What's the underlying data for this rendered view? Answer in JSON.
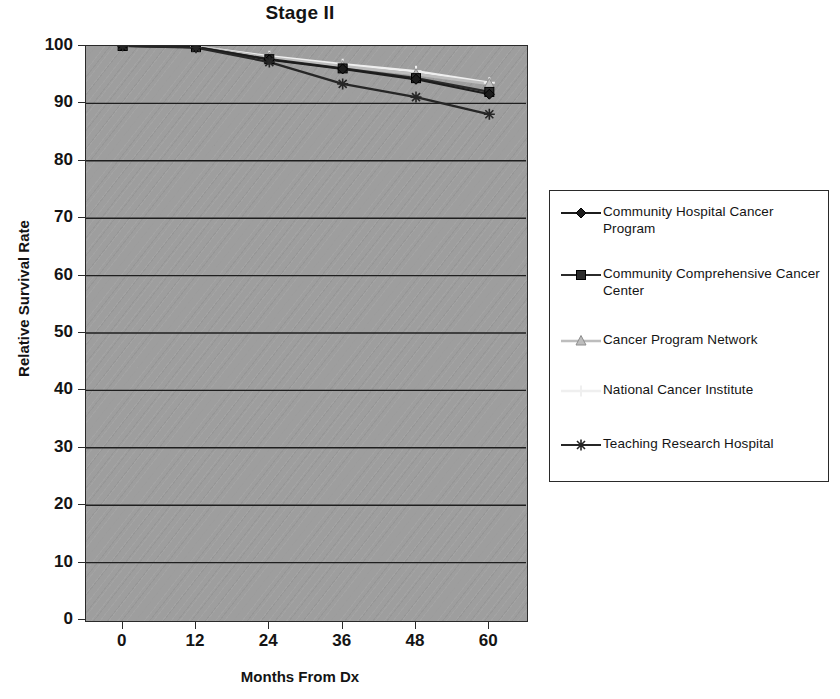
{
  "chart_data": {
    "type": "line",
    "title": "Stage II",
    "xlabel": "Months From Dx",
    "ylabel": "Relative Survival Rate",
    "x": [
      0,
      12,
      24,
      36,
      48,
      60
    ],
    "xticklabels": [
      "0",
      "12",
      "24",
      "36",
      "48",
      "60"
    ],
    "xlim": [
      -6,
      66
    ],
    "ylim": [
      0,
      100
    ],
    "yticks": [
      0,
      10,
      20,
      30,
      40,
      50,
      60,
      70,
      80,
      90,
      100
    ],
    "yticklabels": [
      "0",
      "10",
      "20",
      "30",
      "40",
      "50",
      "60",
      "70",
      "80",
      "90",
      "100"
    ],
    "grid": "horizontal",
    "legend_position": "right",
    "series": [
      {
        "name": "Community Hospital Cancer Program",
        "marker": "diamond",
        "color": "#1c1c1c",
        "values": [
          100,
          99.8,
          97.6,
          96.0,
          94.2,
          91.6
        ]
      },
      {
        "name": "Community Comprehensive Cancer Center",
        "marker": "square",
        "color": "#2b2b2b",
        "values": [
          100,
          99.8,
          97.7,
          96.1,
          94.4,
          92.0
        ]
      },
      {
        "name": "Cancer Program Network",
        "marker": "triangle",
        "color": "#bdbdbd",
        "values": [
          100,
          99.9,
          98.0,
          96.5,
          95.1,
          93.4
        ]
      },
      {
        "name": "National Cancer Institute",
        "marker": "cross",
        "color": "#efefef",
        "values": [
          100,
          99.9,
          98.2,
          96.8,
          95.6,
          93.6
        ]
      },
      {
        "name": "Teaching Research Hospital",
        "marker": "asterisk",
        "color": "#262626",
        "values": [
          100,
          99.7,
          97.2,
          93.4,
          91.1,
          88.1
        ]
      }
    ]
  },
  "legend": {
    "entries": [
      {
        "label": "Community Hospital Cancer Program",
        "marker": "diamond-marker-icon"
      },
      {
        "label": "Community Comprehensive Cancer Center",
        "marker": "square-marker-icon"
      },
      {
        "label": "Cancer Program Network",
        "marker": "triangle-marker-icon"
      },
      {
        "label": "National Cancer Institute",
        "marker": "cross-marker-icon"
      },
      {
        "label": "Teaching Research Hospital",
        "marker": "asterisk-marker-icon"
      }
    ]
  }
}
